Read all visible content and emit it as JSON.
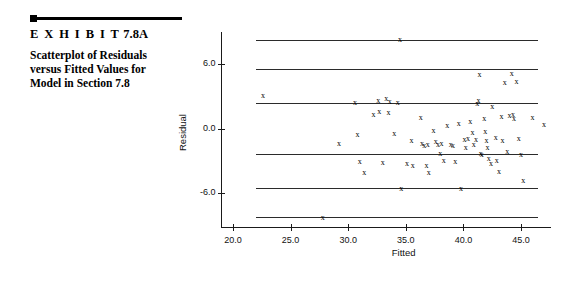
{
  "caption": {
    "exhibit_prefix": "E X H I B I T",
    "exhibit_number": "7.8A",
    "line1": "Scatterplot of Residuals",
    "line2": "versus Fitted Values for",
    "line3": "Model in Section 7.8"
  },
  "chart_data": {
    "type": "scatter",
    "title": "",
    "xlabel": "Fitted",
    "ylabel": "Residual",
    "xlim": [
      19.0,
      47.6
    ],
    "ylim": [
      -9.2,
      9.0
    ],
    "xticks": [
      "20.0",
      "25.0",
      "30.0",
      "35.0",
      "40.0",
      "45.0"
    ],
    "xtick_values": [
      20.0,
      25.0,
      30.0,
      35.0,
      40.0,
      45.0
    ],
    "yticks": [
      "6.0",
      "0.0",
      "-6.0"
    ],
    "ytick_values": [
      6.0,
      0.0,
      -6.0
    ],
    "grid": false,
    "legend": null,
    "reference_lines": [
      8.2,
      5.5,
      2.4,
      -2.4,
      -5.5,
      -8.2
    ],
    "points": [
      {
        "x": 22.6,
        "y": 3.0
      },
      {
        "x": 27.8,
        "y": -8.3
      },
      {
        "x": 29.2,
        "y": -1.4
      },
      {
        "x": 30.6,
        "y": 2.4
      },
      {
        "x": 30.8,
        "y": -0.6
      },
      {
        "x": 31.0,
        "y": -3.1
      },
      {
        "x": 31.4,
        "y": -4.1
      },
      {
        "x": 32.2,
        "y": 1.3
      },
      {
        "x": 32.6,
        "y": 2.6
      },
      {
        "x": 32.7,
        "y": 1.5
      },
      {
        "x": 33.0,
        "y": -3.2
      },
      {
        "x": 33.3,
        "y": 2.7
      },
      {
        "x": 33.5,
        "y": 1.4
      },
      {
        "x": 33.6,
        "y": 2.5
      },
      {
        "x": 34.0,
        "y": -0.5
      },
      {
        "x": 34.3,
        "y": 2.4
      },
      {
        "x": 34.5,
        "y": 8.2
      },
      {
        "x": 34.6,
        "y": -5.6
      },
      {
        "x": 35.1,
        "y": -3.3
      },
      {
        "x": 35.5,
        "y": -1.2
      },
      {
        "x": 35.6,
        "y": -3.5
      },
      {
        "x": 36.3,
        "y": 1.0
      },
      {
        "x": 36.4,
        "y": -1.4
      },
      {
        "x": 36.6,
        "y": -1.6
      },
      {
        "x": 36.8,
        "y": -3.5
      },
      {
        "x": 36.9,
        "y": -1.5
      },
      {
        "x": 37.0,
        "y": -4.1
      },
      {
        "x": 37.4,
        "y": -0.2
      },
      {
        "x": 37.6,
        "y": -1.3
      },
      {
        "x": 37.8,
        "y": -1.5
      },
      {
        "x": 38.0,
        "y": -2.4
      },
      {
        "x": 38.1,
        "y": -1.4
      },
      {
        "x": 38.3,
        "y": -3.0
      },
      {
        "x": 38.6,
        "y": 0.2
      },
      {
        "x": 38.9,
        "y": -1.5
      },
      {
        "x": 39.1,
        "y": -1.6
      },
      {
        "x": 39.3,
        "y": -3.1
      },
      {
        "x": 39.6,
        "y": 0.4
      },
      {
        "x": 39.8,
        "y": -5.6
      },
      {
        "x": 40.1,
        "y": -1.1
      },
      {
        "x": 40.2,
        "y": -1.8
      },
      {
        "x": 40.4,
        "y": -1.0
      },
      {
        "x": 40.6,
        "y": 0.6
      },
      {
        "x": 40.8,
        "y": -0.4
      },
      {
        "x": 40.9,
        "y": -1.5
      },
      {
        "x": 41.1,
        "y": -1.1
      },
      {
        "x": 41.2,
        "y": 2.3
      },
      {
        "x": 41.3,
        "y": 2.6
      },
      {
        "x": 41.4,
        "y": 5.0
      },
      {
        "x": 41.5,
        "y": -2.4
      },
      {
        "x": 41.6,
        "y": -2.5
      },
      {
        "x": 41.8,
        "y": 0.9
      },
      {
        "x": 41.9,
        "y": -0.3
      },
      {
        "x": 42.0,
        "y": -1.2
      },
      {
        "x": 42.1,
        "y": -1.8
      },
      {
        "x": 42.2,
        "y": -2.8
      },
      {
        "x": 42.4,
        "y": -3.3
      },
      {
        "x": 42.5,
        "y": 2.0
      },
      {
        "x": 42.8,
        "y": -0.9
      },
      {
        "x": 42.9,
        "y": -3.0
      },
      {
        "x": 43.1,
        "y": -4.0
      },
      {
        "x": 43.3,
        "y": 1.1
      },
      {
        "x": 43.4,
        "y": -1.2
      },
      {
        "x": 43.6,
        "y": 4.2
      },
      {
        "x": 43.8,
        "y": -2.2
      },
      {
        "x": 44.0,
        "y": 1.2
      },
      {
        "x": 44.2,
        "y": 5.1
      },
      {
        "x": 44.3,
        "y": 1.3
      },
      {
        "x": 44.4,
        "y": 0.9
      },
      {
        "x": 44.6,
        "y": 4.3
      },
      {
        "x": 44.8,
        "y": -1.0
      },
      {
        "x": 45.0,
        "y": -2.5
      },
      {
        "x": 45.2,
        "y": -4.9
      },
      {
        "x": 46.0,
        "y": 1.0
      },
      {
        "x": 47.0,
        "y": 0.3
      }
    ],
    "marker_symbol": "x"
  }
}
